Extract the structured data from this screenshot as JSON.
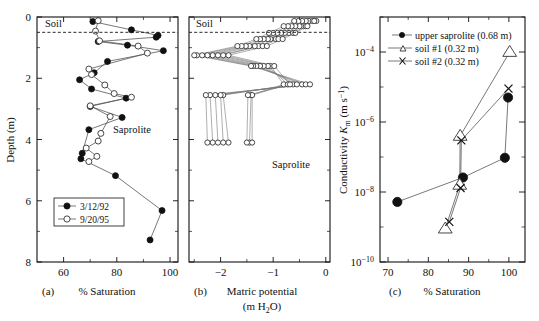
{
  "figure": {
    "background": "#ffffff",
    "ink": "#111111",
    "panels": [
      "a",
      "b",
      "c"
    ]
  },
  "panel_a": {
    "letter": "(a)",
    "xlabel": "% Saturation",
    "ylabel": "Depth (m)",
    "annotation_top": "Soil",
    "annotation_body": "Saprolite",
    "xticks": [
      "60",
      "80",
      "100"
    ],
    "yticks": [
      "0",
      "2",
      "4",
      "6",
      "8"
    ],
    "legend": [
      {
        "label": "3/12/92",
        "marker": "filled-circle"
      },
      {
        "label": "9/20/95",
        "marker": "open-circle"
      }
    ]
  },
  "panel_b": {
    "letter": "(b)",
    "xlabel_line1": "Matric potential",
    "xlabel_line2": "(m H",
    "xlabel_sub": "2",
    "xlabel_line2b": "O)",
    "annotation_top": "Soil",
    "annotation_body": "Saprolite",
    "xticks": [
      "−2",
      "−1",
      "0"
    ],
    "yticks": [
      "0",
      "2",
      "4",
      "6",
      "8"
    ]
  },
  "panel_c": {
    "letter": "(c)",
    "xlabel": "% Saturation",
    "ylabel_main": "Conductivity ",
    "ylabel_sym": "K",
    "ylabel_sub": "m",
    "ylabel_units": " (m s",
    "ylabel_units_sup": "−1",
    "ylabel_units_end": ")",
    "xticks": [
      "70",
      "80",
      "90",
      "100"
    ],
    "yticks": [
      "10",
      "10",
      "10",
      "10"
    ],
    "ytick_exps": [
      "−4",
      "−6",
      "−8",
      "−10"
    ],
    "legend": [
      {
        "label": "upper saprolite (0.68 m)",
        "marker": "filled-circle"
      },
      {
        "label": "soil #1 (0.32 m)",
        "marker": "open-triangle"
      },
      {
        "label": "soil #2 (0.32 m)",
        "marker": "cross-x"
      }
    ]
  },
  "chart_data": [
    {
      "id": "panel-a",
      "type": "line",
      "title": "",
      "xlabel": "% Saturation",
      "ylabel": "Depth (m)",
      "xlim": [
        50,
        103
      ],
      "ylim": [
        0,
        8
      ],
      "y_inverted": true,
      "grid": false,
      "legend_position": "lower-left",
      "annotations": [
        {
          "text": "Soil",
          "x": 54,
          "y": 0.12
        },
        {
          "text": "Saprolite",
          "x": 83,
          "y": 3.55
        },
        {
          "type": "hline-dashed",
          "y": 0.5
        }
      ],
      "series": [
        {
          "name": "3/12/92",
          "marker": "filled-circle",
          "points": [
            [
              71.0,
              0.15
            ],
            [
              85.5,
              0.42
            ],
            [
              95.5,
              0.6
            ],
            [
              94.8,
              0.66
            ],
            [
              73.0,
              0.8
            ],
            [
              84.0,
              0.92
            ],
            [
              97.5,
              1.1
            ],
            [
              76.5,
              1.45
            ],
            [
              71.5,
              1.82
            ],
            [
              66.0,
              2.05
            ],
            [
              70.5,
              2.35
            ],
            [
              83.5,
              2.65
            ],
            [
              70.0,
              2.92
            ],
            [
              82.0,
              3.28
            ],
            [
              69.5,
              3.68
            ],
            [
              67.0,
              4.45
            ],
            [
              66.5,
              4.63
            ],
            [
              79.5,
              5.18
            ],
            [
              97.0,
              6.32
            ],
            [
              92.5,
              7.28
            ]
          ]
        },
        {
          "name": "9/20/95",
          "marker": "open-circle",
          "points": [
            [
              73.0,
              0.12
            ],
            [
              72.0,
              0.46
            ],
            [
              73.5,
              0.78
            ],
            [
              88.0,
              0.95
            ],
            [
              91.5,
              1.18
            ],
            [
              69.5,
              1.7
            ],
            [
              70.5,
              1.88
            ],
            [
              75.5,
              2.22
            ],
            [
              79.0,
              2.5
            ],
            [
              85.5,
              2.62
            ],
            [
              70.0,
              2.9
            ],
            [
              77.5,
              3.25
            ],
            [
              74.0,
              3.8
            ],
            [
              73.0,
              4.05
            ],
            [
              68.5,
              4.28
            ],
            [
              72.5,
              4.55
            ],
            [
              69.5,
              4.72
            ]
          ]
        }
      ]
    },
    {
      "id": "panel-b",
      "type": "line",
      "title": "",
      "xlabel": "Matric potential (m H2O)",
      "ylabel": "Depth (m)",
      "xlim": [
        -2.6,
        0.08
      ],
      "ylim": [
        0,
        8
      ],
      "y_inverted": true,
      "grid": false,
      "marker": "open-circle",
      "annotations": [
        {
          "text": "Soil",
          "x": -2.45,
          "y": 0.12
        },
        {
          "text": "Saprolite",
          "x": -0.72,
          "y": 3.55
        },
        {
          "type": "hline-dashed",
          "y": 0.5
        }
      ],
      "profiles": [
        {
          "depths": [
            0.13,
            0.3,
            0.52,
            0.72,
            0.95,
            1.25,
            1.6,
            2.2,
            2.55,
            4.1
          ],
          "potentials": [
            -0.32,
            -0.42,
            -0.7,
            -0.95,
            -1.28,
            -1.95,
            -1.05,
            -0.8,
            -1.42,
            -1.45
          ]
        },
        {
          "depths": [
            0.13,
            0.3,
            0.52,
            0.72,
            0.95,
            1.25,
            1.6,
            2.2,
            2.55,
            4.1
          ],
          "potentials": [
            -0.25,
            -0.38,
            -0.62,
            -0.9,
            -1.2,
            -2.05,
            -1.1,
            -0.72,
            -1.4,
            -1.4
          ]
        },
        {
          "depths": [
            0.13,
            0.3,
            0.52,
            0.72,
            0.95,
            1.25,
            1.6,
            2.2,
            2.55,
            4.1
          ],
          "potentials": [
            -0.18,
            -0.5,
            -0.78,
            -1.05,
            -1.35,
            -2.15,
            -1.18,
            -0.62,
            -1.95,
            -1.85
          ]
        },
        {
          "depths": [
            0.13,
            0.3,
            0.52,
            0.72,
            0.95,
            1.25,
            1.6,
            2.2,
            2.55,
            4.1
          ],
          "potentials": [
            -0.38,
            -0.58,
            -0.85,
            -1.1,
            -1.45,
            -2.25,
            -1.25,
            -0.55,
            -2.0,
            -1.95
          ]
        },
        {
          "depths": [
            0.13,
            0.3,
            0.52,
            0.72,
            0.95,
            1.25,
            1.6,
            2.2,
            2.55,
            4.1
          ],
          "potentials": [
            -0.45,
            -0.65,
            -0.92,
            -1.18,
            -1.52,
            -2.35,
            -1.32,
            -0.45,
            -2.1,
            -2.05
          ]
        },
        {
          "depths": [
            0.13,
            0.3,
            0.52,
            0.72,
            0.95,
            1.25,
            1.6,
            2.2,
            2.55,
            4.1
          ],
          "potentials": [
            -0.52,
            -0.72,
            -1.0,
            -1.25,
            -1.6,
            -2.45,
            -1.38,
            -0.38,
            -2.2,
            -2.15
          ]
        },
        {
          "depths": [
            0.13,
            0.3,
            0.52,
            0.72,
            0.95,
            1.25,
            1.6,
            2.2,
            2.55,
            4.1
          ],
          "potentials": [
            -0.6,
            -0.8,
            -1.08,
            -1.32,
            -1.68,
            -2.5,
            -1.42,
            -0.3,
            -2.28,
            -2.25
          ]
        },
        {
          "depths": [
            0.13,
            0.3,
            0.52,
            0.72,
            0.95,
            1.25,
            1.6,
            2.2,
            2.55,
            4.1
          ],
          "potentials": [
            -0.22,
            -0.35,
            -0.58,
            -0.82,
            -1.12,
            -1.85,
            -0.98,
            -0.68,
            -1.48,
            -1.5
          ]
        }
      ]
    },
    {
      "id": "panel-c",
      "type": "scatter-line",
      "title": "",
      "xlabel": "% Saturation",
      "ylabel": "Conductivity Km (m s-1)",
      "xlim": [
        68,
        104
      ],
      "ylim": [
        1e-10,
        0.001
      ],
      "yscale": "log",
      "grid": false,
      "legend_position": "upper-left",
      "series": [
        {
          "name": "upper saprolite (0.68 m)",
          "marker": "filled-circle",
          "x": [
            72.3,
            88.6,
            99.0,
            99.8
          ],
          "y": [
            5.2e-09,
            2.6e-08,
            9.5e-08,
            5e-06
          ]
        },
        {
          "name": "soil #1 (0.32 m)",
          "marker": "open-triangle",
          "x": [
            84.2,
            87.8,
            87.9,
            100.2
          ],
          "y": [
            9e-10,
            1.6e-08,
            4e-07,
            0.0001
          ]
        },
        {
          "name": "soil #2 (0.32 m)",
          "marker": "cross-x",
          "x": [
            85.2,
            88.0,
            88.2,
            99.9
          ],
          "y": [
            1.4e-09,
            1.3e-08,
            3e-07,
            9e-06
          ]
        }
      ]
    }
  ]
}
